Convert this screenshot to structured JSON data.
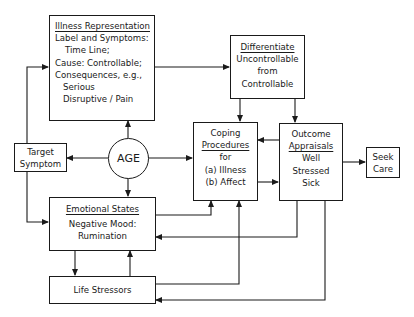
{
  "nodes": {
    "illness": {
      "title": "Illness Representation",
      "lines": [
        "Label and Symptoms:",
        "Time Line;",
        "Cause: Controllable;",
        "Consequences, e.g.,",
        "Serious",
        "Disruptive / Pain"
      ]
    },
    "differentiate": {
      "title": "Differentiate",
      "lines": [
        "Uncontrollable",
        "from",
        "Controllable"
      ]
    },
    "target": {
      "lines": [
        "Target",
        "Symptom"
      ]
    },
    "age": {
      "label": "AGE"
    },
    "coping": {
      "title_lines": [
        "Coping",
        "Procedures"
      ],
      "lines": [
        "for",
        "(a) Illness",
        "(b) Affect"
      ]
    },
    "outcome": {
      "title_lines": [
        "Outcome",
        "Appraisals"
      ],
      "lines": [
        "Well",
        "Stressed",
        "Sick"
      ]
    },
    "seek": {
      "lines": [
        "Seek",
        "Care"
      ]
    },
    "emotional": {
      "title": "Emotional States",
      "lines": [
        "Negative Mood:",
        "Rumination"
      ]
    },
    "stressors": {
      "label": "Life Stressors"
    }
  },
  "edges": [
    {
      "from": "target",
      "to": "illness"
    },
    {
      "from": "target",
      "to": "emotional"
    },
    {
      "from": "age",
      "to": "target"
    },
    {
      "from": "age",
      "to": "illness"
    },
    {
      "from": "age",
      "to": "emotional"
    },
    {
      "from": "age",
      "to": "coping"
    },
    {
      "from": "illness",
      "to": "differentiate"
    },
    {
      "from": "differentiate",
      "to": "coping"
    },
    {
      "from": "differentiate",
      "to": "outcome"
    },
    {
      "from": "outcome",
      "to": "coping"
    },
    {
      "from": "coping",
      "to": "outcome"
    },
    {
      "from": "outcome",
      "to": "seek"
    },
    {
      "from": "emotional",
      "to": "coping"
    },
    {
      "from": "outcome",
      "to": "emotional"
    },
    {
      "from": "emotional",
      "to": "stressors"
    },
    {
      "from": "stressors",
      "to": "emotional"
    },
    {
      "from": "stressors",
      "to": "coping"
    },
    {
      "from": "outcome",
      "to": "stressors"
    }
  ]
}
